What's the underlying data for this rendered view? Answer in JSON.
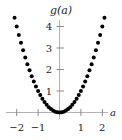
{
  "chart_data": {
    "type": "scatter",
    "title": "g(a)",
    "xlabel": "a",
    "ylabel": "g(a)",
    "xlim": [
      -2.35,
      2.35
    ],
    "ylim": [
      -0.35,
      4.5
    ],
    "grid": false,
    "legend": null,
    "xticks": [
      -2,
      -1,
      1,
      2
    ],
    "xtick_labels": [
      "−2",
      "−1",
      "1",
      "2"
    ],
    "yticks": [
      1,
      2,
      3,
      4
    ],
    "ytick_labels": [
      "1",
      "2",
      "3",
      "4"
    ],
    "marker": "filled-circle",
    "marker_color": "#000000",
    "marker_size_px": 4,
    "axis_color": "#b3b3b3",
    "background_color": "#ffffff",
    "function": "g(a) = a^2",
    "x": [
      -2.1,
      -2.0,
      -1.9,
      -1.8,
      -1.7,
      -1.6,
      -1.5,
      -1.4,
      -1.3,
      -1.2,
      -1.1,
      -1.0,
      -0.9,
      -0.8,
      -0.7,
      -0.6,
      -0.5,
      -0.4,
      -0.3,
      -0.2,
      -0.1,
      0.0,
      0.1,
      0.2,
      0.3,
      0.4,
      0.5,
      0.6,
      0.7,
      0.8,
      0.9,
      1.0,
      1.1,
      1.2,
      1.3,
      1.4,
      1.5,
      1.6,
      1.7,
      1.8,
      1.9,
      2.0,
      2.1
    ],
    "y": [
      4.41,
      4.0,
      3.61,
      3.24,
      2.89,
      2.56,
      2.25,
      1.96,
      1.69,
      1.44,
      1.21,
      1.0,
      0.81,
      0.64,
      0.49,
      0.36,
      0.25,
      0.16,
      0.09,
      0.04,
      0.01,
      0.0,
      0.01,
      0.04,
      0.09,
      0.16,
      0.25,
      0.36,
      0.49,
      0.64,
      0.81,
      1.0,
      1.21,
      1.44,
      1.69,
      1.96,
      2.25,
      2.56,
      2.89,
      3.24,
      3.61,
      4.0,
      4.41
    ]
  }
}
